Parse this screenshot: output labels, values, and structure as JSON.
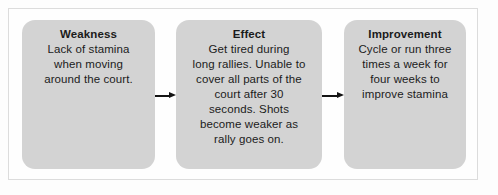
{
  "diagram": {
    "type": "flowchart",
    "direction": "left-to-right",
    "box_fill_color": "#d3d3d3",
    "frame_border_color": "#dcdcdc",
    "arrow_color": "#141414",
    "nodes": [
      {
        "title": "Weakness",
        "lines": [
          "Lack of stamina",
          "when moving",
          "around the court."
        ]
      },
      {
        "title": "Effect",
        "lines": [
          "Get tired during",
          "long rallies. Unable to",
          "cover all parts of the",
          "court after 30",
          "seconds. Shots",
          "become weaker as",
          "rally goes on."
        ]
      },
      {
        "title": "Improvement",
        "lines": [
          "Cycle or run three",
          "times a week for",
          "four weeks to",
          "improve stamina"
        ]
      }
    ],
    "connectors": [
      {
        "from": "Weakness",
        "to": "Effect",
        "glyph": "arrow-right"
      },
      {
        "from": "Effect",
        "to": "Improvement",
        "glyph": "arrow-right"
      }
    ]
  }
}
